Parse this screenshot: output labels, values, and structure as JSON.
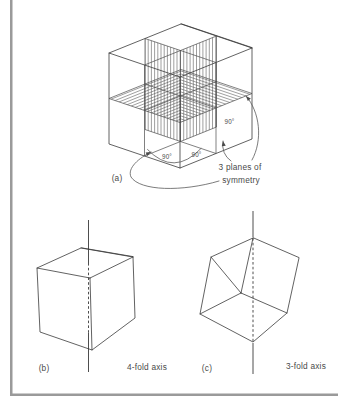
{
  "figure": {
    "panel_a": {
      "label": "(a)",
      "annotation": {
        "line1": "3 planes of",
        "line2": "symmetry"
      },
      "angles": [
        "90°",
        "90°",
        "90°"
      ]
    },
    "panel_b": {
      "label": "(b)",
      "caption": "4-fold axis"
    },
    "panel_c": {
      "label": "(c)",
      "caption": "3-fold axis"
    },
    "colors": {
      "line": "#3a3a3a",
      "text": "#4a4a4a",
      "frame": "#9a9a9a",
      "background": "#ffffff"
    }
  }
}
